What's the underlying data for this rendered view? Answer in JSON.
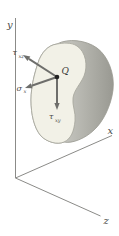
{
  "figure": {
    "kind": "3d-stress-components-diagram",
    "axis_labels": {
      "x": "x",
      "y": "y",
      "z": "z"
    },
    "point_label": "Q",
    "stress_components": [
      {
        "id": "tau_xz",
        "symbol": "τ",
        "subscript": "xz"
      },
      {
        "id": "sigma_x",
        "symbol": "σ",
        "subscript": "x"
      },
      {
        "id": "tau_xy",
        "symbol": "τ",
        "subscript": "xy"
      }
    ],
    "colors": {
      "background": "#ffffff",
      "body_front_face": "#f2f1e7",
      "body_side_light": "#cdcdc7",
      "body_side_dark": "#999992",
      "body_outline": "#9a9a90",
      "axis_line": "#8b8b88",
      "arrow": "#6e6e6b",
      "point_dot": "#222222",
      "label_text": "#4a4a47"
    }
  }
}
